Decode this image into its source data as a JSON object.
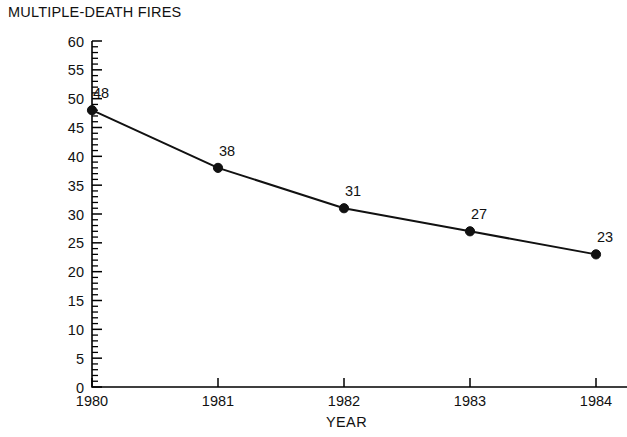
{
  "chart_data": {
    "type": "line",
    "title": "MULTIPLE-DEATH FIRES",
    "subtitle": "",
    "xlabel": "YEAR",
    "ylabel": "",
    "categories": [
      "1980",
      "1981",
      "1982",
      "1983",
      "1984"
    ],
    "x": [
      1980,
      1981,
      1982,
      1983,
      1984
    ],
    "values": [
      48,
      38,
      31,
      27,
      23
    ],
    "point_labels": [
      "48",
      "38",
      "31",
      "27",
      "23"
    ],
    "series": [
      {
        "name": "MULTIPLE-DEATH FIRES",
        "values": [
          48,
          38,
          31,
          27,
          23
        ],
        "color": "#111111",
        "marker": "filled-circle"
      }
    ],
    "ylim": [
      0,
      60
    ],
    "ytick_step_major": 5,
    "ytick_step_minor": 1,
    "ytick_labels": [
      "0",
      "5",
      "10",
      "15",
      "20",
      "25",
      "30",
      "35",
      "40",
      "45",
      "50",
      "55",
      "60"
    ],
    "ytick_values": [
      0,
      5,
      10,
      15,
      20,
      25,
      30,
      35,
      40,
      45,
      50,
      55,
      60
    ],
    "xtick_labels": [
      "1980",
      "1981",
      "1982",
      "1983",
      "1984"
    ],
    "grid": false,
    "legend": false,
    "legend_position": "none",
    "annotations": [],
    "background_color": "#ffffff",
    "axis_color": "#000000"
  }
}
